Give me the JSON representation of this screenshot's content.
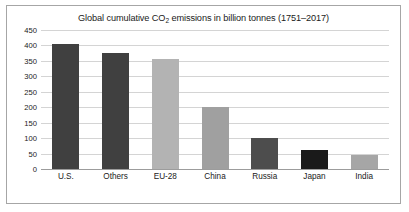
{
  "chart_data": {
    "type": "bar",
    "title": "Global cumulative CO2 emissions in billion tonnes (1751–2017)",
    "title_prefix": "Global cumulative CO",
    "title_subscript": "2",
    "title_suffix": " emissions in billion tonnes (1751–2017)",
    "xlabel": "",
    "ylabel": "",
    "categories": [
      "U.S.",
      "Others",
      "EU-28",
      "China",
      "Russia",
      "Japan",
      "India"
    ],
    "values": [
      405,
      375,
      355,
      200,
      100,
      60,
      45
    ],
    "colors": [
      "#404040",
      "#404040",
      "#b3b3b3",
      "#a0a0a0",
      "#4d4d4d",
      "#1a1a1a",
      "#a6a6a6"
    ],
    "ylim": [
      0,
      450
    ],
    "ytick_values": [
      0,
      50,
      100,
      150,
      200,
      250,
      300,
      350,
      400,
      450
    ],
    "ytick_labels": [
      "0",
      "50",
      "100",
      "150",
      "200",
      "250",
      "300",
      "350",
      "400",
      "450"
    ],
    "grid": true,
    "legend": "none",
    "border_color": "#a6a6a6",
    "gridline_color": "#d4d4d4",
    "axis_color": "#9c9c9c",
    "background": "#ffffff"
  }
}
